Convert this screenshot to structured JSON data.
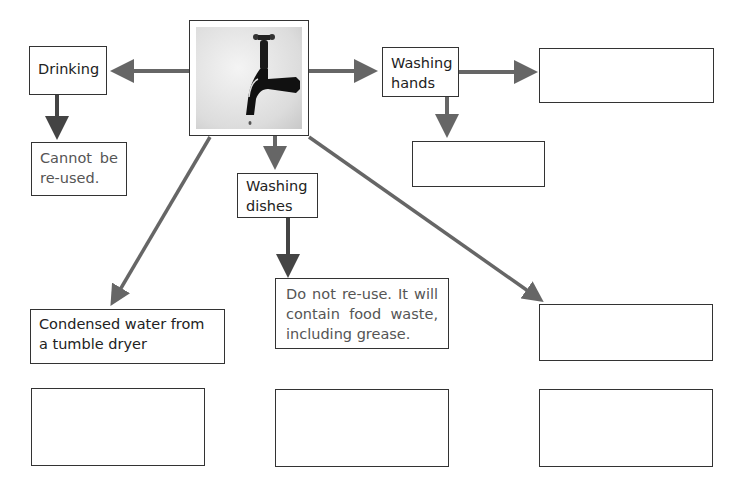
{
  "diagram": {
    "center": {
      "label": "",
      "icon": "water-tap-icon"
    },
    "nodes": {
      "drinking": {
        "label": "Drinking"
      },
      "drinking_outcome": {
        "label": "Cannot be re-used."
      },
      "washing_hands": {
        "label": "Washing hands"
      },
      "washing_hands_right": {
        "label": ""
      },
      "washing_hands_below": {
        "label": ""
      },
      "washing_dishes": {
        "label": "Washing dishes"
      },
      "washing_dishes_outcome": {
        "label": "Do not re-use. It will contain food waste, including grease."
      },
      "condensed_water": {
        "label": "Condensed water from a tumble dryer"
      },
      "right_middle": {
        "label": ""
      },
      "bottom_left": {
        "label": ""
      },
      "bottom_middle": {
        "label": ""
      },
      "bottom_right": {
        "label": ""
      }
    },
    "colors": {
      "arrow": "#666666",
      "arrow_dark": "#444444",
      "border": "#333333"
    }
  }
}
